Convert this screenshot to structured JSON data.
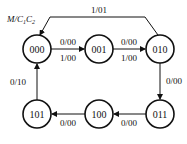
{
  "diagram": {
    "header": {
      "var": "M/C",
      "sub1": "1",
      "mid": "C",
      "sub2": "2"
    },
    "states": [
      {
        "id": "s000",
        "label": "000"
      },
      {
        "id": "s001",
        "label": "001"
      },
      {
        "id": "s010",
        "label": "010"
      },
      {
        "id": "s011",
        "label": "011"
      },
      {
        "id": "s100",
        "label": "100"
      },
      {
        "id": "s101",
        "label": "101"
      }
    ],
    "transitions": {
      "t000_001_top": "0/00",
      "t000_001_bot": "1/00",
      "t001_010_top": "0/00",
      "t001_010_bot": "1/00",
      "t010_000": "1/01",
      "t010_011": "0/00",
      "t011_100": "0/00",
      "t100_101": "0/00",
      "t101_000": "0/10"
    }
  }
}
